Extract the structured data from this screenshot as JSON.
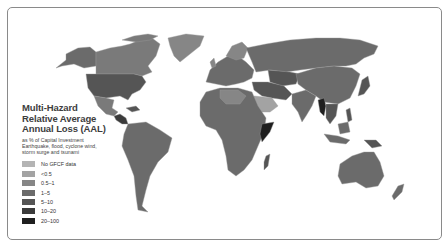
{
  "legend": {
    "title_lines": [
      "Multi-Hazard",
      "Relative Average",
      "Annual Loss (AAL)"
    ],
    "subtitle_lines": [
      "as % of Capital Investment",
      "Earthquake, flood, cyclone wind,",
      "storm surge and tsunami"
    ],
    "classes": [
      {
        "label": "No GFCF data",
        "color": "#b4b4b4"
      },
      {
        "label": "<0.5",
        "color": "#a3a3a3"
      },
      {
        "label": "0.5–1",
        "color": "#868686"
      },
      {
        "label": "1–5",
        "color": "#6b6b6b"
      },
      {
        "label": "5–10",
        "color": "#555555"
      },
      {
        "label": "10–20",
        "color": "#3b3b3b"
      },
      {
        "label": "20–100",
        "color": "#1f1f1f"
      }
    ]
  },
  "map": {
    "regions": [
      {
        "name": "Alaska",
        "color": "#6b6b6b"
      },
      {
        "name": "Canada",
        "color": "#7a7a7a"
      },
      {
        "name": "Greenland",
        "color": "#868686"
      },
      {
        "name": "United States",
        "color": "#555555"
      },
      {
        "name": "Mexico",
        "color": "#7a7a7a"
      },
      {
        "name": "Central America",
        "color": "#3b3b3b"
      },
      {
        "name": "South America",
        "color": "#6b6b6b"
      },
      {
        "name": "Europe",
        "color": "#6b6b6b"
      },
      {
        "name": "Russia",
        "color": "#6b6b6b"
      },
      {
        "name": "Africa",
        "color": "#6b6b6b"
      },
      {
        "name": "Arabian Peninsula",
        "color": "#a3a3a3"
      },
      {
        "name": "Somalia",
        "color": "#1f1f1f"
      },
      {
        "name": "Madagascar",
        "color": "#555555"
      },
      {
        "name": "Middle East",
        "color": "#555555"
      },
      {
        "name": "India",
        "color": "#6b6b6b"
      },
      {
        "name": "China",
        "color": "#6b6b6b"
      },
      {
        "name": "Myanmar",
        "color": "#1f1f1f"
      },
      {
        "name": "Southeast Asia",
        "color": "#555555"
      },
      {
        "name": "Japan",
        "color": "#555555"
      },
      {
        "name": "Indonesia",
        "color": "#6b6b6b"
      },
      {
        "name": "Papua New Guinea",
        "color": "#555555"
      },
      {
        "name": "Australia",
        "color": "#6b6b6b"
      },
      {
        "name": "New Zealand",
        "color": "#6b6b6b"
      }
    ]
  }
}
